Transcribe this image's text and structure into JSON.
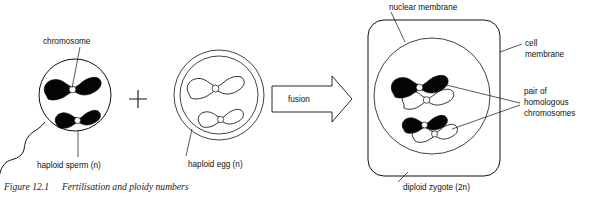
{
  "figure": {
    "caption_number": "Figure 12.1",
    "caption_title": "Fertilisation and ploidy numbers",
    "operator": "+",
    "process_label": "fusion"
  },
  "labels": {
    "chromosome": "chromosome",
    "haploid_sperm": "haploid sperm (n)",
    "haploid_egg": "haploid egg (n)",
    "nuclear_membrane": "nuclear membrane",
    "cell_membrane_line1": "cell",
    "cell_membrane_line2": "membrane",
    "homologous_line1": "pair of",
    "homologous_line2": "homologous",
    "homologous_line3": "chromosomes",
    "diploid_zygote": "diploid zygote (2n)"
  },
  "cells": {
    "sperm": {
      "name": "haploid sperm",
      "ploidy": "n",
      "chromosome_count": 2,
      "chromosome_fill": "black",
      "has_tail": true,
      "membrane_rings": 1
    },
    "egg": {
      "name": "haploid egg",
      "ploidy": "n",
      "chromosome_count": 2,
      "chromosome_fill": "white",
      "has_tail": false,
      "membrane_rings": 2
    },
    "zygote": {
      "name": "diploid zygote",
      "ploidy": "2n",
      "chromosome_pairs": 2,
      "chromosome_fill": "black and white pairs",
      "shape": "rounded-rectangle",
      "has_nucleus": true
    }
  },
  "colors": {
    "ink": "#111111",
    "chromosome_maternal": "#ffffff",
    "chromosome_paternal": "#050505",
    "background": "#ffffff"
  }
}
